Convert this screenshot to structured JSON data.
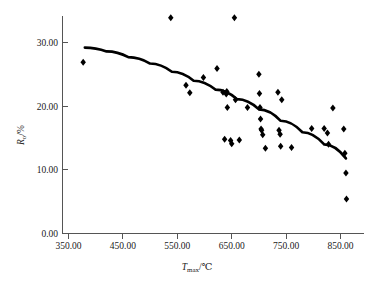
{
  "chart_data": {
    "type": "scatter",
    "title": "",
    "xlabel": "T_max/°C",
    "ylabel": "R_o/%",
    "xlabel_main": "T",
    "xlabel_sub": "max",
    "xlabel_unit": "/℃",
    "ylabel_main": "R",
    "ylabel_sub": "o",
    "ylabel_unit": "/%",
    "xlim": [
      320,
      890
    ],
    "ylim": [
      0,
      35
    ],
    "xticks": [
      350,
      450,
      550,
      650,
      750,
      850
    ],
    "xtick_labels": [
      "350.00",
      "450.00",
      "550.00",
      "650.00",
      "750.00",
      "850.00"
    ],
    "yticks": [
      0,
      10,
      20,
      30
    ],
    "ytick_labels": [
      "0.00",
      "10.00",
      "20.00",
      "30.00"
    ],
    "grid": false,
    "legend": null,
    "marker": "diamond",
    "marker_color": "#000000",
    "series": [
      {
        "name": "samples",
        "points": [
          [
            377,
            26.9
          ],
          [
            538,
            33.9
          ],
          [
            566,
            23.3
          ],
          [
            573,
            22.1
          ],
          [
            598,
            24.5
          ],
          [
            623,
            25.9
          ],
          [
            634,
            22.2
          ],
          [
            637,
            14.8
          ],
          [
            640,
            21.9
          ],
          [
            641,
            22.3
          ],
          [
            642,
            19.8
          ],
          [
            648,
            14.6
          ],
          [
            650,
            14.1
          ],
          [
            655,
            33.9
          ],
          [
            657,
            21.0
          ],
          [
            664,
            14.7
          ],
          [
            679,
            19.8
          ],
          [
            700,
            25.0
          ],
          [
            701,
            22.0
          ],
          [
            702,
            19.8
          ],
          [
            703,
            18.0
          ],
          [
            704,
            16.4
          ],
          [
            705,
            16.2
          ],
          [
            707,
            15.5
          ],
          [
            712,
            13.4
          ],
          [
            735,
            22.2
          ],
          [
            737,
            16.2
          ],
          [
            739,
            15.6
          ],
          [
            740,
            13.7
          ],
          [
            742,
            21.0
          ],
          [
            760,
            13.5
          ],
          [
            797,
            16.5
          ],
          [
            820,
            16.5
          ],
          [
            826,
            15.8
          ],
          [
            828,
            14.0
          ],
          [
            836,
            19.7
          ],
          [
            856,
            16.4
          ],
          [
            858,
            12.6
          ],
          [
            860,
            9.5
          ],
          [
            861,
            5.4
          ]
        ]
      }
    ],
    "trend": {
      "name": "fitted-curve",
      "color": "#000000",
      "points": [
        [
          380,
          29.2
        ],
        [
          420,
          28.6
        ],
        [
          460,
          27.7
        ],
        [
          500,
          26.7
        ],
        [
          540,
          25.4
        ],
        [
          580,
          24.0
        ],
        [
          620,
          22.6
        ],
        [
          660,
          21.1
        ],
        [
          700,
          19.5
        ],
        [
          740,
          17.7
        ],
        [
          780,
          15.9
        ],
        [
          820,
          14.0
        ],
        [
          860,
          11.8
        ]
      ]
    }
  }
}
